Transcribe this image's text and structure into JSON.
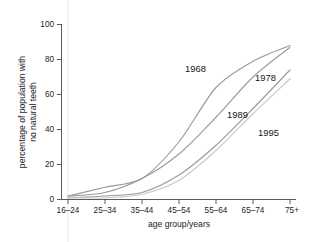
{
  "chart_data": {
    "type": "line",
    "title": "",
    "xlabel": "age group/years",
    "ylabel": "percentage of population with no natural teeth",
    "ylabel_line1": "percentage of population with",
    "ylabel_line2": "no natural teeth",
    "categories": [
      "16–24",
      "25–34",
      "35–44",
      "45–54",
      "55–64",
      "65–74",
      "75+"
    ],
    "ylim": [
      0,
      100
    ],
    "yticks": [
      0,
      20,
      40,
      60,
      80,
      100
    ],
    "ytick_labels": [
      "0",
      "20",
      "40",
      "60",
      "80",
      "100"
    ],
    "grid": false,
    "legend_position": "inline-annotations",
    "series": [
      {
        "name": "1968",
        "values": [
          2,
          7,
          12,
          33,
          64,
          79,
          88
        ],
        "color": "#9a9a9a",
        "label_x": 185,
        "label_y": 72
      },
      {
        "name": "1978",
        "values": [
          2,
          4,
          12,
          26,
          47,
          70,
          87
        ],
        "color": "#9a9a9a",
        "label_x": 255,
        "label_y": 81
      },
      {
        "name": "1989",
        "values": [
          1,
          2,
          4,
          14,
          31,
          52,
          74
        ],
        "color": "#9a9a9a",
        "label_x": 227,
        "label_y": 118
      },
      {
        "name": "1995",
        "values": [
          1,
          1,
          3,
          11,
          28,
          49,
          69
        ],
        "color": "#c9c9c9",
        "label_x": 258,
        "label_y": 136
      }
    ]
  },
  "axes": {
    "x_title": "age group/years",
    "y_title_line1": "percentage of population with",
    "y_title_line2": "no natural teeth",
    "y_tick_0": "0",
    "y_tick_20": "20",
    "y_tick_40": "40",
    "y_tick_60": "60",
    "y_tick_80": "80",
    "y_tick_100": "100",
    "x_tick_0": "16–24",
    "x_tick_1": "25–34",
    "x_tick_2": "35–44",
    "x_tick_3": "45–54",
    "x_tick_4": "55–64",
    "x_tick_5": "65–74",
    "x_tick_6": "75+"
  },
  "series_labels": {
    "s0": "1968",
    "s1": "1978",
    "s2": "1989",
    "s3": "1995"
  },
  "colors": {
    "line_dark": "#9a9a9a",
    "line_light": "#c9c9c9",
    "axis": "#4a4a4a",
    "text": "#1c1c1c",
    "background": "#ffffff"
  }
}
